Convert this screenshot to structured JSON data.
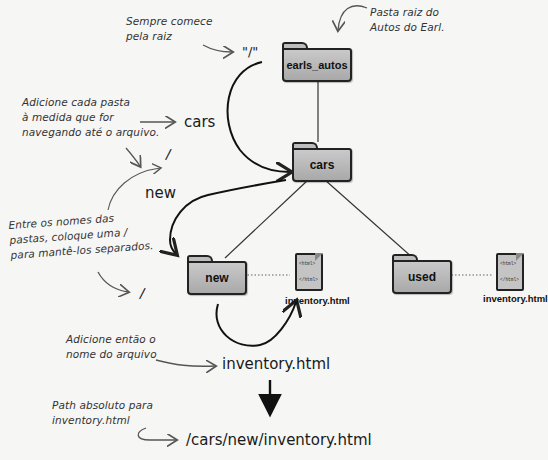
{
  "annotations": {
    "start_root": [
      "Sempre comece",
      "pela raiz"
    ],
    "root_folder": [
      "Pasta raiz do",
      "Autos do Earl."
    ],
    "add_folder": [
      "Adicione cada pasta",
      "à medida que for",
      "navegando até o arquivo."
    ],
    "separator": [
      "Entre os nomes das",
      "pastas, coloque uma /",
      "para mantê-los separados."
    ],
    "add_file": [
      "Adicione então o",
      "nome do arquivo"
    ],
    "absolute_path": [
      "Path absoluto para",
      "inventory.html"
    ]
  },
  "path_segments": {
    "root": "\"/\"",
    "cars": "cars",
    "slash1": "/",
    "new": "new",
    "slash2": "/",
    "file": "inventory.html",
    "result": "/cars/new/inventory.html"
  },
  "tree": {
    "root": "earls_autos",
    "cars": "cars",
    "new": "new",
    "used": "used",
    "file_new": {
      "name": "inventory.html",
      "open_tag": "<html>",
      "close_tag": "</html>"
    },
    "file_used": {
      "name": "inventory.html",
      "open_tag": "<html>",
      "close_tag": "</html>"
    }
  },
  "colors": {
    "background": "#f6f6f4",
    "folder_fill": "#b8b8b8",
    "ink": "#222222"
  }
}
